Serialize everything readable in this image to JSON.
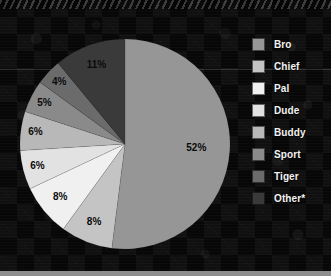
{
  "chart_data": {
    "type": "pie",
    "title": "",
    "categories": [
      "Bro",
      "Chief",
      "Pal",
      "Dude",
      "Buddy",
      "Sport",
      "Tiger",
      "Other*"
    ],
    "values": [
      52,
      8,
      8,
      6,
      6,
      5,
      4,
      11
    ],
    "value_labels": [
      "52%",
      "8%",
      "8%",
      "6%",
      "6%",
      "5%",
      "4%",
      "11%"
    ],
    "colors": [
      "#969696",
      "#c4c4c4",
      "#f0f0f0",
      "#e2e2e2",
      "#b8b8b8",
      "#8a8a8a",
      "#6b6b6b",
      "#3a3a3a"
    ],
    "legend_position": "right",
    "start_angle_deg": 0,
    "direction": "clockwise",
    "grid": false,
    "units": "percent"
  },
  "legend": {
    "items": [
      {
        "label": "Bro",
        "color": "#969696",
        "value": "52%"
      },
      {
        "label": "Chief",
        "color": "#c4c4c4",
        "value": "8%"
      },
      {
        "label": "Pal",
        "color": "#f0f0f0",
        "value": "8%"
      },
      {
        "label": "Dude",
        "color": "#e2e2e2",
        "value": "6%"
      },
      {
        "label": "Buddy",
        "color": "#b8b8b8",
        "value": "6%"
      },
      {
        "label": "Sport",
        "color": "#8a8a8a",
        "value": "5%"
      },
      {
        "label": "Tiger",
        "color": "#6b6b6b",
        "value": "4%"
      },
      {
        "label": "Other*",
        "color": "#3a3a3a",
        "value": "11%"
      }
    ]
  },
  "theme": {
    "background": "#070707",
    "footer_bar": "#8e8e8e",
    "legend_text": "#f2f2f2",
    "slice_label_text": "#0b0b0b"
  }
}
